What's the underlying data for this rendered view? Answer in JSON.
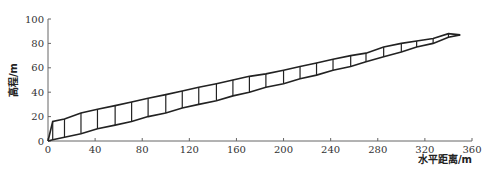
{
  "chart_data": {
    "type": "line",
    "title": "",
    "xlabel": "水平距离/m",
    "ylabel": "高程/m",
    "xlim": [
      0,
      360
    ],
    "ylim": [
      0,
      100
    ],
    "x_ticks": [
      0,
      40,
      80,
      120,
      160,
      200,
      240,
      280,
      320,
      360
    ],
    "y_ticks": [
      0,
      20,
      40,
      60,
      80,
      100
    ],
    "grid": false,
    "legend": null,
    "series": [
      {
        "name": "upper-profile",
        "x": [
          0,
          4,
          14,
          28,
          42,
          57,
          71,
          85,
          100,
          114,
          128,
          143,
          157,
          171,
          185,
          200,
          214,
          228,
          242,
          257,
          270,
          285,
          300,
          313,
          327,
          340,
          350
        ],
        "y": [
          0,
          16,
          18,
          23,
          26,
          29,
          32,
          35,
          38,
          41,
          44,
          47,
          50,
          53,
          55,
          58,
          61,
          64,
          67,
          70,
          72,
          77,
          80,
          82,
          84,
          88,
          87
        ]
      },
      {
        "name": "lower-profile",
        "x": [
          0,
          4,
          14,
          28,
          42,
          57,
          71,
          85,
          100,
          114,
          128,
          143,
          157,
          171,
          185,
          200,
          214,
          228,
          242,
          257,
          270,
          285,
          300,
          313,
          327,
          340,
          350
        ],
        "y": [
          0,
          1,
          3,
          6,
          10,
          13,
          16,
          20,
          23,
          27,
          30,
          33,
          37,
          40,
          44,
          47,
          51,
          54,
          58,
          61,
          65,
          69,
          73,
          77,
          80,
          85,
          87
        ]
      }
    ],
    "verticals_at_x": [
      4,
      14,
      28,
      42,
      57,
      71,
      85,
      100,
      114,
      128,
      143,
      157,
      171,
      185,
      200,
      214,
      228,
      242,
      257,
      270,
      285,
      300,
      313,
      327,
      340
    ]
  }
}
